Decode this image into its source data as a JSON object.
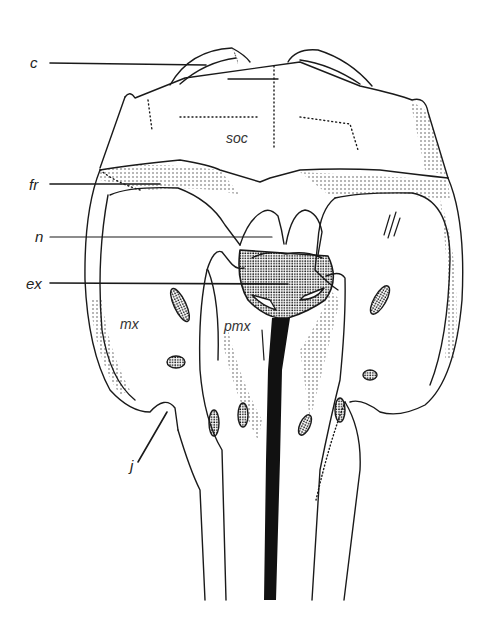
{
  "figure": {
    "type": "anatomical line drawing",
    "view": "dorsal view of skull",
    "leader_labels": [
      {
        "id": "c",
        "text": "c",
        "x": 30,
        "y": 62
      },
      {
        "id": "fr",
        "text": "fr",
        "x": 29,
        "y": 184
      },
      {
        "id": "n",
        "text": "n",
        "x": 35,
        "y": 236
      },
      {
        "id": "ex",
        "text": "ex",
        "x": 26,
        "y": 283
      },
      {
        "id": "j",
        "text": "j",
        "x": 132,
        "y": 467
      }
    ],
    "inline_labels": [
      {
        "id": "soc",
        "text": "soc",
        "x": 226,
        "y": 130
      },
      {
        "id": "mx",
        "text": "mx",
        "x": 120,
        "y": 322
      },
      {
        "id": "pmx",
        "text": "pmx",
        "x": 224,
        "y": 325
      }
    ],
    "colors": {
      "ink": "#1a1a1a",
      "paper": "#ffffff"
    }
  }
}
